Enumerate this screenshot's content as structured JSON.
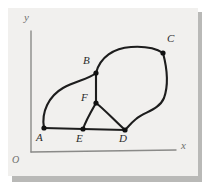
{
  "figure": {
    "background_color": "#f1f0ee",
    "shadow_color": "#b9b9b7",
    "axis_color": "#8a8a88",
    "edge_color": "#1d1d1d",
    "node_color": "#111111",
    "label_color": "#2b2b2b"
  },
  "axes": {
    "origin_label": "O",
    "x_label": "x",
    "y_label": "y",
    "x_axis": {
      "x1": 31,
      "y1": 152,
      "x2": 176,
      "y2": 150
    },
    "y_axis": {
      "x1": 31,
      "y1": 31,
      "x2": 31,
      "y2": 152
    },
    "origin_label_pos": {
      "x": 13,
      "y": 155
    },
    "x_label_pos": {
      "x": 182,
      "y": 142
    },
    "y_label_pos": {
      "x": 25,
      "y": 14
    }
  },
  "nodes": [
    {
      "id": "A",
      "x": 44,
      "y": 128,
      "label": "A",
      "label_x": 38,
      "label_y": 133
    },
    {
      "id": "B",
      "x": 96,
      "y": 73,
      "label": "B",
      "label_x": 83,
      "label_y": 57
    },
    {
      "id": "C",
      "x": 163,
      "y": 53,
      "label": "C",
      "label_x": 168,
      "label_y": 35
    },
    {
      "id": "D",
      "x": 125,
      "y": 130,
      "label": "D",
      "label_x": 120,
      "label_y": 134
    },
    {
      "id": "E",
      "x": 83,
      "y": 129,
      "label": "E",
      "label_x": 77,
      "label_y": 133
    },
    {
      "id": "F",
      "x": 96,
      "y": 103,
      "label": "F",
      "label_x": 82,
      "label_y": 94
    }
  ],
  "edges": [
    {
      "from": "A",
      "to": "B",
      "style": "curve-left-bulge"
    },
    {
      "from": "A",
      "to": "E",
      "style": "straight"
    },
    {
      "from": "E",
      "to": "D",
      "style": "straight"
    },
    {
      "from": "E",
      "to": "F",
      "style": "straight"
    },
    {
      "from": "F",
      "to": "D",
      "style": "curve"
    },
    {
      "from": "B",
      "to": "F",
      "style": "straight-vertical"
    },
    {
      "from": "B",
      "to": "C",
      "style": "curve-top-arc"
    },
    {
      "from": "C",
      "to": "D",
      "style": "curve-s-right"
    }
  ]
}
